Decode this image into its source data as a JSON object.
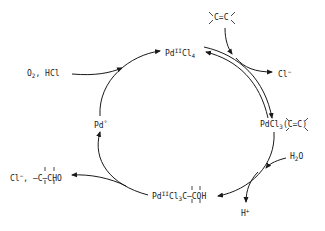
{
  "diagram": {
    "species": {
      "pdcl4": {
        "base": "Pd",
        "sup": "II",
        "rest": "Cl",
        "sub": "4"
      },
      "pd_alkene": {
        "base": "PdCl",
        "sub": "3",
        "rest": "(C=C)"
      },
      "pd_alkyl": {
        "base": "Pd",
        "sup": "II",
        "rest": "Cl",
        "sub": "3",
        "tail": "C–COH"
      },
      "pd0": {
        "base": "Pd",
        "sup": "°"
      }
    },
    "reagents": {
      "alkene": "C=C",
      "cl_out": {
        "base": "Cl",
        "sup": "−"
      },
      "water": {
        "base": "H",
        "sub": "2",
        "rest": "O"
      },
      "proton": {
        "base": "H",
        "sup": "+"
      },
      "oxidant": {
        "base": "O",
        "sub": "2",
        "rest": ", HCl"
      },
      "product": {
        "base": "Cl",
        "sup": "−",
        "rest": ", –C–CHO"
      }
    },
    "colors": {
      "ink": "#1a1a1a",
      "background": "#ffffff"
    }
  }
}
